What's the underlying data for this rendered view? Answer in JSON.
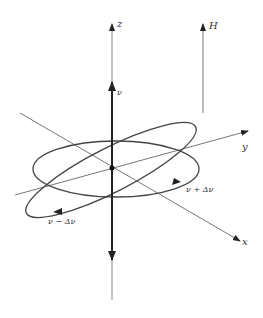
{
  "diagram": {
    "type": "precession-3d-axes",
    "labels": {
      "z_axis": "z",
      "y_axis": "y",
      "x_axis": "x",
      "field": "H",
      "frequency": "ν",
      "upper_sideband": "ν + Δν",
      "lower_sideband": "ν − Δν"
    },
    "colors": {
      "axis": "#777777",
      "thick_vector": "#333333",
      "ellipse": "#444444",
      "background": "#ffffff"
    }
  }
}
